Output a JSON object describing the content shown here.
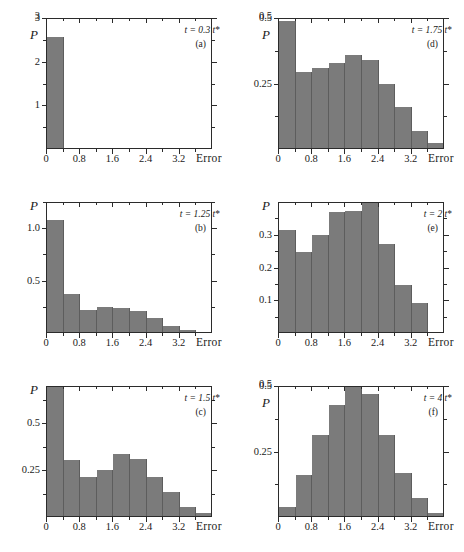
{
  "figure": {
    "background": "#ffffff",
    "bar_color": "#7b7b7b",
    "bar_edge_color": "#5d5d5d",
    "axis_color": "#2b2b2b",
    "x_axis_title": "Error",
    "y_axis_title": "P",
    "bin_width": 0.4,
    "x_major_labels": [
      "0",
      "0.8",
      "1.6",
      "2.4",
      "3.2"
    ],
    "x_major_values": [
      0,
      0.8,
      1.6,
      2.4,
      3.2
    ],
    "x_minor_values": [
      0.4,
      1.2,
      2.0,
      2.8,
      3.6
    ],
    "xlim": [
      0,
      4.0
    ]
  },
  "chart_data": [
    {
      "type": "bar",
      "panel": "a",
      "panel_label": "(a)",
      "annotation": "t = 0.3 t*",
      "annotation_time": "0.3",
      "title": "",
      "xlabel": "Error",
      "ylabel": "P",
      "xlim": [
        0,
        4.0
      ],
      "ylim": [
        0,
        3
      ],
      "ytick_labels": [
        "1",
        "2",
        "3"
      ],
      "ytick_values": [
        1,
        2,
        3
      ],
      "y_minor_values": [
        0.5,
        1.5,
        2.5
      ],
      "bin_width": 0.4,
      "bin_starts": [
        0,
        0.4,
        0.8,
        1.2,
        1.6,
        2.0,
        2.4,
        2.8,
        3.2,
        3.6
      ],
      "values": [
        2.55,
        0,
        0,
        0,
        0,
        0,
        0,
        0,
        0,
        0
      ],
      "grid": false,
      "legend": "none"
    },
    {
      "type": "bar",
      "panel": "b",
      "panel_label": "(b)",
      "annotation": "t = 1.25 t*",
      "annotation_time": "1.25",
      "title": "",
      "xlabel": "Error",
      "ylabel": "P",
      "xlim": [
        0,
        4.0
      ],
      "ylim": [
        0,
        1.25
      ],
      "ytick_labels": [
        "0.5",
        "1.0"
      ],
      "ytick_values": [
        0.5,
        1.0
      ],
      "y_minor_values": [
        0.25,
        0.75,
        1.25
      ],
      "bin_width": 0.4,
      "bin_starts": [
        0,
        0.4,
        0.8,
        1.2,
        1.6,
        2.0,
        2.4,
        2.8,
        3.2,
        3.6
      ],
      "values": [
        1.07,
        0.36,
        0.21,
        0.24,
        0.23,
        0.2,
        0.13,
        0.06,
        0.02,
        0.0
      ],
      "grid": false,
      "legend": "none"
    },
    {
      "type": "bar",
      "panel": "c",
      "panel_label": "(c)",
      "annotation": "t = 1.5 t*",
      "annotation_time": "1.5",
      "title": "",
      "xlabel": "Error",
      "ylabel": "P",
      "xlim": [
        0,
        4.0
      ],
      "ylim": [
        0,
        0.7
      ],
      "ytick_labels": [
        "0.25",
        "0.5"
      ],
      "ytick_values": [
        0.25,
        0.5
      ],
      "y_minor_values": [
        0.125,
        0.375,
        0.625
      ],
      "bin_width": 0.4,
      "bin_starts": [
        0,
        0.4,
        0.8,
        1.2,
        1.6,
        2.0,
        2.4,
        2.8,
        3.2,
        3.6
      ],
      "values": [
        0.7,
        0.3,
        0.21,
        0.245,
        0.33,
        0.305,
        0.21,
        0.13,
        0.05,
        0.015
      ],
      "grid": false,
      "legend": "none"
    },
    {
      "type": "bar",
      "panel": "d",
      "panel_label": "(d)",
      "annotation": "t = 1.75 t*",
      "annotation_time": "1.75",
      "title": "",
      "xlabel": "Error",
      "ylabel": "P",
      "xlim": [
        0,
        4.0
      ],
      "ylim": [
        0,
        0.5
      ],
      "ytick_labels": [
        "0.25",
        "0.5"
      ],
      "ytick_values": [
        0.25,
        0.5
      ],
      "y_minor_values": [
        0.125,
        0.375
      ],
      "bin_width": 0.4,
      "bin_starts": [
        0,
        0.4,
        0.8,
        1.2,
        1.6,
        2.0,
        2.4,
        2.8,
        3.2,
        3.6
      ],
      "values": [
        0.485,
        0.29,
        0.305,
        0.325,
        0.355,
        0.335,
        0.245,
        0.155,
        0.065,
        0.02
      ],
      "grid": false,
      "legend": "none"
    },
    {
      "type": "bar",
      "panel": "e",
      "panel_label": "(e)",
      "annotation": "t = 2 t*",
      "annotation_time": "2",
      "title": "",
      "xlabel": "Error",
      "ylabel": "P",
      "xlim": [
        0,
        4.0
      ],
      "ylim": [
        0,
        0.4
      ],
      "ytick_labels": [
        "0.1",
        "0.2",
        "0.3"
      ],
      "ytick_values": [
        0.1,
        0.2,
        0.3
      ],
      "y_minor_values": [
        0.05,
        0.15,
        0.25,
        0.35
      ],
      "bin_width": 0.4,
      "bin_starts": [
        0,
        0.4,
        0.8,
        1.2,
        1.6,
        2.0,
        2.4,
        2.8,
        3.2,
        3.6
      ],
      "values": [
        0.31,
        0.245,
        0.295,
        0.365,
        0.37,
        0.4,
        0.27,
        0.145,
        0.09,
        0.0
      ],
      "grid": false,
      "legend": "none"
    },
    {
      "type": "bar",
      "panel": "f",
      "panel_label": "(f)",
      "annotation": "t = 4 t*",
      "annotation_time": "4",
      "title": "",
      "xlabel": "Error",
      "ylabel": "P",
      "xlim": [
        0,
        4.0
      ],
      "ylim": [
        0,
        0.5
      ],
      "ytick_labels": [
        "0.25",
        "0.5"
      ],
      "ytick_values": [
        0.25,
        0.5
      ],
      "y_minor_values": [
        0.125,
        0.375
      ],
      "bin_width": 0.4,
      "bin_starts": [
        0,
        0.4,
        0.8,
        1.2,
        1.6,
        2.0,
        2.4,
        2.8,
        3.2,
        3.6
      ],
      "values": [
        0.035,
        0.155,
        0.31,
        0.425,
        0.5,
        0.465,
        0.31,
        0.165,
        0.07,
        0.01
      ],
      "grid": false,
      "legend": "none"
    }
  ]
}
